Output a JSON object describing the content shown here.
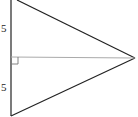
{
  "diagram": {
    "type": "triangle-with-altitude",
    "labels": {
      "upper_segment": "5",
      "lower_segment": "5"
    },
    "right_angle_marker": true,
    "colors": {
      "stroke": "#222222",
      "altitude": "#aaaaaa",
      "background": "#ffffff"
    }
  }
}
